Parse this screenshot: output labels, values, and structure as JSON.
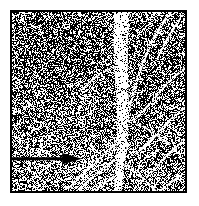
{
  "figure": {
    "kind": "halftone-micrograph",
    "caption": "",
    "background_color": "#ffffff",
    "ink_color": "#000000",
    "highlight_color": "#ffffff"
  },
  "frame": {
    "x": 10,
    "y": 10,
    "width": 177,
    "height": 183,
    "border_width": 2,
    "border_color": "#000000"
  },
  "texture": {
    "type": "random-dither",
    "grain_px": 1,
    "black_fraction": 0.52,
    "seed": 20250214,
    "density_zones": [
      {
        "name": "upper-left-dark",
        "cx": 0.3,
        "cy": 0.22,
        "rx": 0.34,
        "ry": 0.28,
        "delta": 0.12
      },
      {
        "name": "upper-right-dark",
        "cx": 0.82,
        "cy": 0.26,
        "rx": 0.22,
        "ry": 0.26,
        "delta": 0.1
      },
      {
        "name": "mid-right-dark",
        "cx": 0.72,
        "cy": 0.52,
        "rx": 0.24,
        "ry": 0.22,
        "delta": 0.07
      },
      {
        "name": "lower-left-light",
        "cx": 0.22,
        "cy": 0.84,
        "rx": 0.3,
        "ry": 0.2,
        "delta": -0.1
      },
      {
        "name": "lower-center-light",
        "cx": 0.55,
        "cy": 0.9,
        "rx": 0.26,
        "ry": 0.16,
        "delta": -0.07
      }
    ]
  },
  "structures": {
    "main_band": {
      "name": "primary-vertical-band",
      "color": "#ffffff",
      "points": [
        [
          0.635,
          -0.02
        ],
        [
          0.632,
          0.08
        ],
        [
          0.628,
          0.18
        ],
        [
          0.63,
          0.3
        ],
        [
          0.636,
          0.42
        ],
        [
          0.642,
          0.54
        ],
        [
          0.64,
          0.66
        ],
        [
          0.632,
          0.78
        ],
        [
          0.622,
          0.88
        ],
        [
          0.614,
          0.96
        ],
        [
          0.61,
          1.03
        ]
      ],
      "width_profile": [
        0.09,
        0.086,
        0.082,
        0.078,
        0.074,
        0.07,
        0.064,
        0.058,
        0.052,
        0.046,
        0.042
      ]
    },
    "branches": [
      {
        "name": "branch-upper-right-long",
        "color": "#ffffff",
        "width": 0.016,
        "points": [
          [
            0.93,
            -0.02
          ],
          [
            0.86,
            0.08
          ],
          [
            0.8,
            0.18
          ],
          [
            0.75,
            0.3
          ],
          [
            0.71,
            0.42
          ],
          [
            0.68,
            0.52
          ],
          [
            0.66,
            0.6
          ]
        ]
      },
      {
        "name": "branch-upper-right-short",
        "color": "#ffffff",
        "width": 0.012,
        "points": [
          [
            0.985,
            0.02
          ],
          [
            0.93,
            0.1
          ],
          [
            0.88,
            0.18
          ],
          [
            0.84,
            0.26
          ]
        ]
      },
      {
        "name": "branch-right-upper-diagonal",
        "color": "#ffffff",
        "width": 0.013,
        "points": [
          [
            1.02,
            0.3
          ],
          [
            0.94,
            0.36
          ],
          [
            0.86,
            0.44
          ],
          [
            0.79,
            0.52
          ],
          [
            0.72,
            0.59
          ]
        ]
      },
      {
        "name": "branch-right-mid-diagonal",
        "color": "#ffffff",
        "width": 0.014,
        "points": [
          [
            1.02,
            0.52
          ],
          [
            0.94,
            0.58
          ],
          [
            0.86,
            0.66
          ],
          [
            0.79,
            0.73
          ],
          [
            0.72,
            0.79
          ]
        ]
      },
      {
        "name": "branch-right-lower-diagonal",
        "color": "#ffffff",
        "width": 0.013,
        "points": [
          [
            1.02,
            0.7
          ],
          [
            0.94,
            0.76
          ],
          [
            0.87,
            0.83
          ],
          [
            0.8,
            0.9
          ],
          [
            0.74,
            0.96
          ]
        ]
      },
      {
        "name": "branch-right-lowest",
        "color": "#ffffff",
        "width": 0.011,
        "points": [
          [
            1.02,
            0.88
          ],
          [
            0.95,
            0.93
          ],
          [
            0.88,
            0.98
          ],
          [
            0.83,
            1.02
          ]
        ]
      },
      {
        "name": "branch-left-lower-upper",
        "color": "#ffffff",
        "width": 0.014,
        "points": [
          [
            0.62,
            0.72
          ],
          [
            0.54,
            0.79
          ],
          [
            0.46,
            0.86
          ],
          [
            0.39,
            0.92
          ],
          [
            0.33,
            0.98
          ]
        ]
      },
      {
        "name": "branch-left-lower-main",
        "color": "#ffffff",
        "width": 0.015,
        "points": [
          [
            0.625,
            0.8
          ],
          [
            0.545,
            0.86
          ],
          [
            0.47,
            0.92
          ],
          [
            0.4,
            0.98
          ],
          [
            0.35,
            1.03
          ]
        ]
      },
      {
        "name": "branch-left-lowest",
        "color": "#ffffff",
        "width": 0.012,
        "points": [
          [
            0.615,
            0.9
          ],
          [
            0.54,
            0.95
          ],
          [
            0.47,
            1.0
          ],
          [
            0.42,
            1.04
          ]
        ]
      },
      {
        "name": "branch-right-bottom-fork",
        "color": "#ffffff",
        "width": 0.012,
        "points": [
          [
            0.65,
            0.84
          ],
          [
            0.72,
            0.9
          ],
          [
            0.79,
            0.96
          ],
          [
            0.85,
            1.02
          ]
        ]
      },
      {
        "name": "branch-mid-right-tendril",
        "color": "#ffffff",
        "width": 0.01,
        "points": [
          [
            0.68,
            0.6
          ],
          [
            0.76,
            0.64
          ],
          [
            0.84,
            0.69
          ],
          [
            0.91,
            0.74
          ]
        ]
      },
      {
        "name": "branch-left-upper-faint",
        "color": "#ffffff",
        "width": 0.009,
        "points": [
          [
            0.6,
            0.3
          ],
          [
            0.52,
            0.34
          ],
          [
            0.45,
            0.39
          ],
          [
            0.4,
            0.44
          ]
        ]
      }
    ]
  },
  "annotation": {
    "arrow": {
      "name": "pointer-arrow",
      "color": "#000000",
      "shaft_y": 0.82,
      "shaft_x_start": -0.01,
      "shaft_x_end": 0.405,
      "shaft_thickness": 3,
      "head_length": 0.115,
      "head_half_height": 0.032,
      "direction": "right"
    }
  }
}
